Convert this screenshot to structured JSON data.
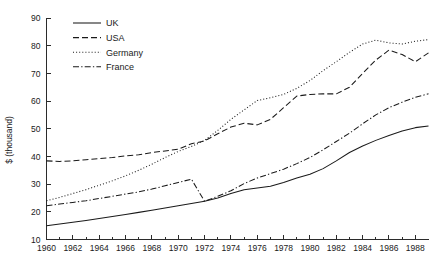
{
  "chart_data": {
    "type": "line",
    "title": "",
    "subtitle": "",
    "xlabel": "",
    "ylabel": "$ (thousand)",
    "xlim": [
      1960,
      1989
    ],
    "ylim": [
      10,
      90
    ],
    "ytick_step": 10,
    "grid": false,
    "legend_position": "top-left",
    "x": [
      1960,
      1961,
      1962,
      1963,
      1964,
      1965,
      1966,
      1967,
      1968,
      1969,
      1970,
      1971,
      1972,
      1973,
      1974,
      1975,
      1976,
      1977,
      1978,
      1979,
      1980,
      1981,
      1982,
      1983,
      1984,
      1985,
      1986,
      1987,
      1988,
      1989
    ],
    "xtick_labels": [
      "1960",
      "1962",
      "1964",
      "1966",
      "1968",
      "1970",
      "1972",
      "1974",
      "1976",
      "1978",
      "1980",
      "1982",
      "1984",
      "1986",
      "1988"
    ],
    "ytick_labels": [
      "10",
      "20",
      "30",
      "40",
      "50",
      "60",
      "70",
      "80",
      "90"
    ],
    "series": [
      {
        "name": "UK",
        "style": "solid",
        "values": [
          15.0,
          15.6,
          16.2,
          16.9,
          17.6,
          18.3,
          19.0,
          19.8,
          20.6,
          21.4,
          22.2,
          23.0,
          23.8,
          25.0,
          26.6,
          28.0,
          28.6,
          29.2,
          30.6,
          32.2,
          33.6,
          35.6,
          38.4,
          41.4,
          43.8,
          45.8,
          47.6,
          49.2,
          50.4,
          51.0
        ]
      },
      {
        "name": "USA",
        "style": "dashed",
        "values": [
          38.4,
          38.2,
          38.4,
          38.8,
          39.2,
          39.6,
          40.2,
          40.6,
          41.4,
          42.0,
          42.6,
          44.6,
          45.6,
          48.2,
          50.6,
          52.0,
          51.4,
          53.4,
          57.6,
          61.8,
          62.4,
          62.6,
          62.6,
          65.0,
          70.0,
          74.8,
          78.4,
          76.8,
          74.2,
          77.4
        ]
      },
      {
        "name": "Germany",
        "style": "dotted",
        "values": [
          24.0,
          25.2,
          26.6,
          28.0,
          29.6,
          31.2,
          33.0,
          35.0,
          37.2,
          39.6,
          41.8,
          43.6,
          45.8,
          49.4,
          53.4,
          56.8,
          60.2,
          61.2,
          62.4,
          64.6,
          67.4,
          71.0,
          74.2,
          77.6,
          80.6,
          82.0,
          81.0,
          80.6,
          81.6,
          82.2
        ]
      },
      {
        "name": "France",
        "style": "dashdot",
        "values": [
          22.2,
          22.8,
          23.4,
          24.0,
          24.8,
          25.6,
          26.4,
          27.2,
          28.2,
          29.4,
          30.6,
          31.8,
          23.8,
          25.6,
          27.6,
          30.2,
          32.2,
          33.8,
          35.4,
          37.4,
          39.6,
          42.4,
          45.4,
          48.4,
          51.8,
          55.0,
          57.6,
          59.6,
          61.4,
          62.6
        ]
      }
    ],
    "legend_entries": [
      {
        "label": "UK",
        "style": "solid"
      },
      {
        "label": "USA",
        "style": "dashed"
      },
      {
        "label": "Germany",
        "style": "dotted"
      },
      {
        "label": "France",
        "style": "dashdot"
      }
    ],
    "colors": {
      "series_ink": "#1a1a1a",
      "axis": "#2b2b2b",
      "background": "#ffffff"
    }
  }
}
